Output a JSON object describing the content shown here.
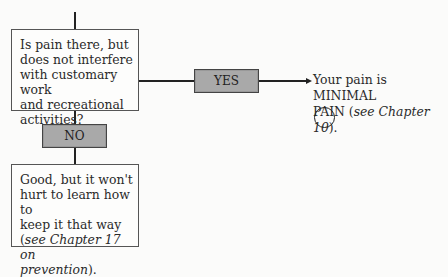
{
  "question_box": {
    "lines": [
      "Is pain there, but",
      "does not interfere",
      "with customary work",
      "and recreational",
      "activities?"
    ]
  },
  "yes_label": "YES",
  "no_label": "NO",
  "yes_result": {
    "line1": "Your pain is MINIMAL",
    "line2_prefix": "PAIN (",
    "line2_italic": "see Chapter 10",
    "line2_suffix": ")."
  },
  "no_result": {
    "lines": [
      "Good, but it won't",
      "hurt to learn how to",
      "keep it that way"
    ],
    "italic_line1_prefix": "(",
    "italic_line1": "see Chapter 17 on",
    "italic_line2": "prevention",
    "italic_line2_suffix": ")."
  },
  "checkbox_circle": "empty"
}
